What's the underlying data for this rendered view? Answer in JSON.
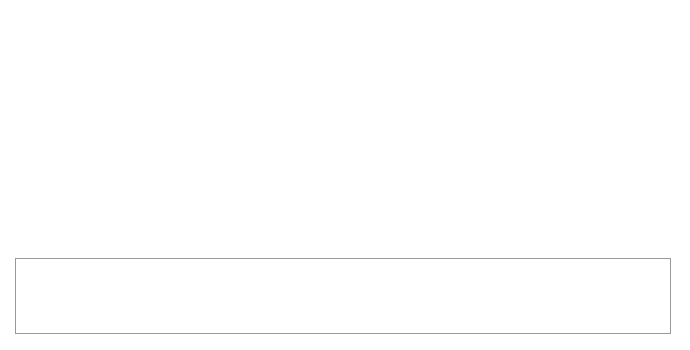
{
  "chart_data": {
    "type": "pie",
    "title": "",
    "subtitle": "",
    "xlabel": "",
    "ylabel": "",
    "legend_position": "bottom",
    "grid": false,
    "three_d": true,
    "value_suffix": "%",
    "categories": [
      "Soles (Type 1)",
      "Soles (Type 2)",
      "Soles (Type 3)",
      "Soles (Type 4)",
      "Soles (Type 5)",
      "Soles (Type 6)",
      "Soles (Type 7)",
      "Soles (Type 8)",
      "Soles (Type 9)",
      "Soles (Seat cut across waist)",
      "Soles (Not Definable)",
      "Soles (Seats)",
      "Soles (Waist Fragments)",
      "Soles (with Oval Foreparts)",
      "Soles (with Rounded Foreparts)",
      "Soles (with Pointed Foreparts)",
      "Soles (Foreparts)"
    ],
    "values": [
      7,
      6,
      8,
      3,
      2,
      1,
      1,
      2,
      3,
      6,
      40,
      9,
      1,
      2,
      2,
      3,
      4
    ],
    "colors": [
      "#4c4c4c",
      "#8e8e8e",
      "#050505",
      "#272727",
      "#5a5a5a",
      "#c9c9c9",
      "#6e6e6e",
      "#8a8a8a",
      "#1a1a1a",
      "#d4d4d4",
      "#535353",
      "#dcdcdc",
      "#3f3f3f",
      "#9b9b9b",
      "#2e2e2e",
      "#bdbdbd",
      "#fbfbfb"
    ],
    "slice_labels": [
      "7 %",
      "6 %",
      "8 %",
      "3 %",
      "2 %",
      "1 %",
      "1 %",
      "2 %",
      "3 %",
      "6 %",
      "4 0 %",
      "9 %",
      "1 %",
      "2 %",
      "2 %",
      "3 %",
      "4 %"
    ]
  },
  "legend": {
    "rows": [
      [
        {
          "label": "Soles (Type 1)",
          "color": "#4c4c4c"
        },
        {
          "label": "Soles (Type 2)",
          "color": "#8e8e8e"
        },
        {
          "label": "Soles (Type 3)",
          "color": "#050505"
        },
        {
          "label": "Soles (Type 4)",
          "color": "#272727"
        },
        {
          "label": "Soles (Type 5)",
          "color": "#5a5a5a"
        }
      ],
      [
        {
          "label": "Soles (Type 6)",
          "color": "#c9c9c9"
        },
        {
          "label": "Soles (Type 7)",
          "color": "#6e6e6e"
        },
        {
          "label": "Soles (Type 8)",
          "color": "#8a8a8a"
        },
        {
          "label": "Soles (Type 9)",
          "color": "#1a1a1a"
        },
        {
          "label": "Soles (Seat cut across waist)",
          "color": "#d4d4d4"
        }
      ],
      [
        {
          "label": "Soles (Not Definable)",
          "color": "#535353"
        },
        {
          "label": "Soles (Seats)",
          "color": "#dcdcdc"
        },
        {
          "label": "Soles (Waist Fragments)",
          "color": "#3f3f3f"
        },
        {
          "label": "Soles (with Oval Foreparts)",
          "color": "#9b9b9b"
        },
        {
          "label": "Soles (with Rounded Foreparts)",
          "color": "#2e2e2e"
        }
      ],
      [
        {
          "label": "Soles (with Pointed Foreparts)",
          "color": "#bdbdbd"
        },
        {
          "label": "Soles (Foreparts)",
          "color": "#fbfbfb"
        }
      ]
    ]
  }
}
